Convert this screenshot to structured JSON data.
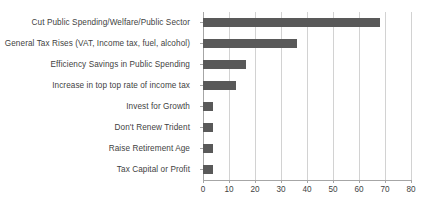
{
  "chart_data": {
    "type": "bar",
    "orientation": "horizontal",
    "title": "",
    "xlabel": "",
    "ylabel": "",
    "categories": [
      "Cut Public Spending/Welfare/Public Sector",
      "General Tax Rises (VAT, Income tax, fuel, alcohol)",
      "Efficiency Savings in Public Spending",
      "Increase in top top rate of income tax",
      "Invest for Growth",
      "Don't Renew Trident",
      "Raise Retirement Age",
      "Tax Capital or Profit"
    ],
    "values": [
      68,
      36,
      16.5,
      12.5,
      4,
      4,
      4,
      4
    ],
    "xlim": [
      0,
      80
    ],
    "xticks": [
      0,
      10,
      20,
      30,
      40,
      50,
      60,
      70,
      80
    ],
    "xtick_labels": [
      "0",
      "10",
      "20",
      "30",
      "40",
      "50",
      "60",
      "70",
      "80"
    ],
    "grid": true,
    "grid_axis": "x",
    "legend": false,
    "bar_color": "#595959",
    "gridline_color": "#d2d2d2",
    "axis_color": "#a6a6a6",
    "text_color": "#3f3f3f",
    "background_color": "#ffffff"
  }
}
